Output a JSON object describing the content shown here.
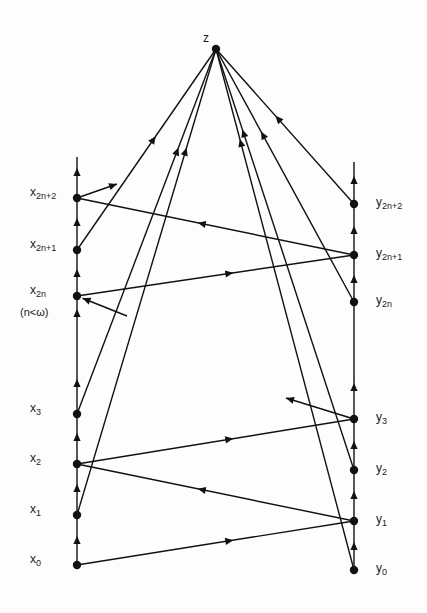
{
  "diagram": {
    "stroke_color": "#111111",
    "background": "#fdfdfd",
    "apex": {
      "id": "z",
      "label": "z",
      "x": 216,
      "y": 49,
      "label_x": 203,
      "label_y": 32
    },
    "left_column": {
      "x": 77,
      "top": 157,
      "bottom": 565,
      "nodes": [
        {
          "id": "x_2n+2",
          "base": "x",
          "sub": "2n+2",
          "y": 198
        },
        {
          "id": "x_2n+1",
          "base": "x",
          "sub": "2n+1",
          "y": 250
        },
        {
          "id": "x_2n",
          "base": "x",
          "sub": "2n",
          "y": 296
        },
        {
          "id": "x_3",
          "base": "x",
          "sub": "3",
          "y": 414
        },
        {
          "id": "x_2",
          "base": "x",
          "sub": "2",
          "y": 464
        },
        {
          "id": "x_1",
          "base": "x",
          "sub": "1",
          "y": 515
        },
        {
          "id": "x_0",
          "base": "x",
          "sub": "0",
          "y": 565
        }
      ],
      "arrow_ys": [
        172,
        222,
        273,
        313,
        383,
        437,
        488,
        540
      ],
      "note": "(n<ω)"
    },
    "right_column": {
      "x": 354,
      "top": 162,
      "bottom": 570,
      "nodes": [
        {
          "id": "y_2n+2",
          "base": "y",
          "sub": "2n+2",
          "y": 204
        },
        {
          "id": "y_2n+1",
          "base": "y",
          "sub": "2n+1",
          "y": 255
        },
        {
          "id": "y_2n",
          "base": "y",
          "sub": "2n",
          "y": 302
        },
        {
          "id": "y_3",
          "base": "y",
          "sub": "3",
          "y": 419
        },
        {
          "id": "y_2",
          "base": "y",
          "sub": "2",
          "y": 470
        },
        {
          "id": "y_1",
          "base": "y",
          "sub": "1",
          "y": 521
        },
        {
          "id": "y_0",
          "base": "y",
          "sub": "0",
          "y": 570
        }
      ],
      "arrow_ys": [
        180,
        230,
        279,
        387,
        445,
        495,
        546
      ]
    },
    "edges": [
      {
        "from": "x_0",
        "to": "y_1",
        "arrow_at": 0.55
      },
      {
        "from": "y_1",
        "to": "x_2",
        "arrow_at": 0.55
      },
      {
        "from": "x_2",
        "to": "y_3",
        "arrow_at": 0.55
      },
      {
        "from": "x_2n",
        "to": "y_2n+1",
        "arrow_at": 0.55
      },
      {
        "from": "y_2n+1",
        "to": "x_2n+2",
        "arrow_at": 0.55
      },
      {
        "from": "x_1",
        "to": "z",
        "arrow_at": 0.78
      },
      {
        "from": "x_3",
        "to": "z",
        "arrow_at": 0.72
      },
      {
        "from": "x_2n+1",
        "to": "z",
        "arrow_at": 0.55
      },
      {
        "from": "y_0",
        "to": "z",
        "arrow_at": 0.82
      },
      {
        "from": "y_2",
        "to": "z",
        "arrow_at": 0.8
      },
      {
        "from": "y_2n",
        "to": "z",
        "arrow_at": 0.66
      },
      {
        "from": "y_2n+2",
        "to": "z",
        "arrow_at": 0.55
      }
    ],
    "stubs": [
      {
        "from": "x_2n+2",
        "to_x": 117,
        "to_y": 184
      },
      {
        "from": "y_3",
        "to_x": 286,
        "to_y": 398
      },
      {
        "from_x": 127,
        "from_y": 316,
        "to": "x_2n"
      }
    ]
  }
}
